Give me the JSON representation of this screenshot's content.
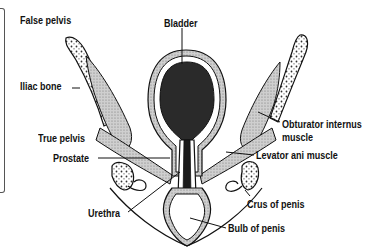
{
  "diagram": {
    "type": "anatomical cross-section",
    "labels": {
      "false_pelvis": "False pelvis",
      "bladder": "Bladder",
      "iliac_bone": "Iliac bone",
      "obturator_internus_1": "Obturator internus",
      "obturator_internus_2": "muscle",
      "true_pelvis": "True pelvis",
      "levator_ani": "Levator ani muscle",
      "prostate": "Prostate",
      "crus_of_penis": "Crus of penis",
      "urethra": "Urethra",
      "bulb_of_penis": "Bulb of penis"
    },
    "colors": {
      "ink": "#111111",
      "bladder_fill": "#2a2a2a",
      "muscle_fill": "#bdbdbd",
      "background": "#ffffff"
    }
  }
}
